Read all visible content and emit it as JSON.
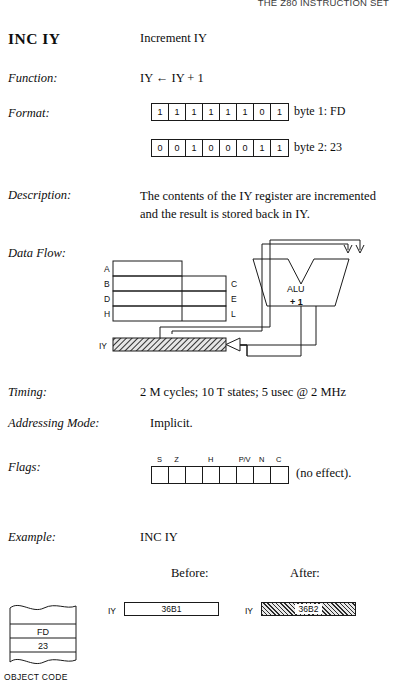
{
  "running_head": "THE Z80 INSTRUCTION SET",
  "instruction": {
    "mnemonic": "INC  IY",
    "summary": "Increment IY"
  },
  "rows": {
    "function_label": "Function:",
    "function_value": "IY ← IY + 1",
    "format_label": "Format:",
    "description_label": "Description:",
    "description_value": "The contents of the IY register are incremented and the result is stored back in IY.",
    "dataflow_label": "Data Flow:",
    "timing_label": "Timing:",
    "timing_value": "2 M cycles; 10 T states; 5 usec @ 2 MHz",
    "addressing_label": "Addressing Mode:",
    "addressing_value": "Implicit.",
    "flags_label": "Flags:",
    "example_label": "Example:",
    "example_value": "INC   IY"
  },
  "format": {
    "byte1": {
      "bits": [
        "1",
        "1",
        "1",
        "1",
        "1",
        "1",
        "0",
        "1"
      ],
      "caption": "byte 1: FD"
    },
    "byte2": {
      "bits": [
        "0",
        "0",
        "1",
        "0",
        "0",
        "0",
        "1",
        "1"
      ],
      "caption": "byte 2: 23"
    }
  },
  "dataflow": {
    "registers_left": [
      "A",
      "B",
      "D",
      "H"
    ],
    "registers_right": [
      "C",
      "E",
      "L"
    ],
    "iy_label": "IY",
    "alu_label": "ALU",
    "alu_op": "+ 1"
  },
  "flags": {
    "names": [
      "S",
      "Z",
      "",
      "H",
      "",
      "P/V",
      "N",
      "C"
    ],
    "values": [
      "",
      "",
      "",
      "",
      "",
      "",
      "",
      ""
    ],
    "note": "(no effect)."
  },
  "example": {
    "before_label": "Before:",
    "after_label": "After:",
    "before": {
      "reg": "IY",
      "value": "36B1"
    },
    "after": {
      "reg": "IY",
      "value": "36B2"
    }
  },
  "object_code": {
    "bytes": [
      "FD",
      "23"
    ],
    "caption": "OBJECT CODE"
  }
}
